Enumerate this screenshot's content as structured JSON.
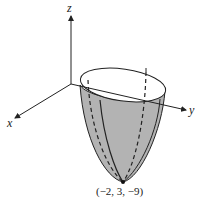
{
  "figure": {
    "axes": {
      "x_label": "x",
      "y_label": "y",
      "z_label": "z"
    },
    "surface": "elliptic paraboloid opening upward",
    "vertex_label": "(−2, 3, −9)",
    "colors": {
      "surface_fill": "#b3b3b3",
      "rim_fill": "#ffffff",
      "line": "#222222"
    }
  }
}
